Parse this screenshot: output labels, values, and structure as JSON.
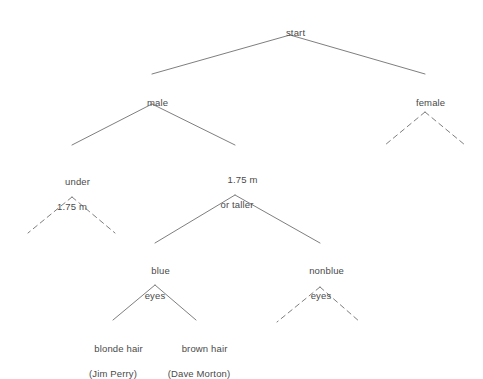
{
  "diagram": {
    "type": "decision-tree",
    "title": "start",
    "background_color": "#ffffff",
    "text_color": "#4a4a4a",
    "line_color": "#6f6f6f",
    "nodes": {
      "root": {
        "label": "start",
        "line1": "start",
        "line2": ""
      },
      "male": {
        "label": "male",
        "line1": "male",
        "line2": ""
      },
      "female": {
        "label": "female",
        "line1": "female",
        "line2": ""
      },
      "under": {
        "label": "under 1.75 m",
        "line1": "under",
        "line2": "1.75 m"
      },
      "taller": {
        "label": "1.75 m or taller",
        "line1": "1.75 m",
        "line2": "or taller"
      },
      "blue_eyes": {
        "label": "blue eyes",
        "line1": "blue",
        "line2": "eyes"
      },
      "nonblue_eyes": {
        "label": "nonblue eyes",
        "line1": "nonblue",
        "line2": "eyes"
      },
      "blonde": {
        "label": "blonde hair (Jim Perry)",
        "line1": "blonde hair",
        "line2": "(Jim Perry)"
      },
      "brown": {
        "label": "brown hair (Dave Morton)",
        "line1": "brown hair",
        "line2": "(Dave Morton)"
      }
    },
    "edges": [
      {
        "from": "start",
        "to": "male",
        "style": "solid"
      },
      {
        "from": "start",
        "to": "female",
        "style": "solid"
      },
      {
        "from": "male",
        "to": "under 1.75 m",
        "style": "solid"
      },
      {
        "from": "male",
        "to": "1.75 m or taller",
        "style": "solid"
      },
      {
        "from": "female",
        "to": "unspecified-left",
        "style": "dashed"
      },
      {
        "from": "female",
        "to": "unspecified-right",
        "style": "dashed"
      },
      {
        "from": "under 1.75 m",
        "to": "unspecified-left",
        "style": "dashed"
      },
      {
        "from": "under 1.75 m",
        "to": "unspecified-right",
        "style": "dashed"
      },
      {
        "from": "1.75 m or taller",
        "to": "blue eyes",
        "style": "solid"
      },
      {
        "from": "1.75 m or taller",
        "to": "nonblue eyes",
        "style": "solid"
      },
      {
        "from": "blue eyes",
        "to": "blonde hair (Jim Perry)",
        "style": "solid"
      },
      {
        "from": "blue eyes",
        "to": "brown hair (Dave Morton)",
        "style": "solid"
      },
      {
        "from": "nonblue eyes",
        "to": "unspecified-left",
        "style": "dashed"
      },
      {
        "from": "nonblue eyes",
        "to": "unspecified-right",
        "style": "dashed"
      }
    ]
  }
}
